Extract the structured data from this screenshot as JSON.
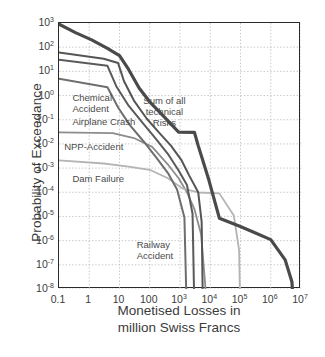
{
  "chart_data": {
    "type": "line",
    "title": "",
    "xlabel": "Monetised Losses in million Swiss Francs",
    "ylabel": "Probability of Exceedance",
    "xscale": "log",
    "yscale": "log",
    "xlim": [
      0.1,
      10000000
    ],
    "ylim": [
      1e-08,
      1000
    ],
    "grid": true,
    "legend_position": "inline-annotations",
    "xticks": [
      "0.1",
      "1",
      "10",
      "100",
      "10³",
      "10⁴",
      "10⁵",
      "10⁶",
      "10⁷"
    ],
    "xtick_values": [
      0.1,
      1,
      10,
      100,
      1000,
      10000,
      100000,
      1000000,
      10000000
    ],
    "yticks": [
      "10³",
      "10²",
      "10¹",
      "10⁰",
      "10⁻¹",
      "10⁻²",
      "10⁻³",
      "10⁻⁴",
      "10⁻⁵",
      "10⁻⁶",
      "10⁻⁷",
      "10⁻⁸"
    ],
    "ytick_values": [
      1000,
      100,
      10,
      1,
      0.1,
      0.01,
      0.001,
      0.0001,
      1e-05,
      1e-06,
      1e-07,
      1e-08
    ],
    "series": [
      {
        "name": "Sum of all technical Risks",
        "color": "#4a4a4a",
        "width": 3.2,
        "points": [
          [
            0.1,
            900
          ],
          [
            0.35,
            400
          ],
          [
            1.2,
            200
          ],
          [
            4,
            90
          ],
          [
            10,
            45
          ],
          [
            20,
            12
          ],
          [
            45,
            2.0
          ],
          [
            100,
            0.55
          ],
          [
            300,
            0.13
          ],
          [
            900,
            0.031
          ],
          [
            3000,
            0.03
          ],
          [
            4000,
            0.0085
          ],
          [
            9000,
            0.00032
          ],
          [
            20000,
            8.5e-06
          ],
          [
            90000,
            4e-06
          ],
          [
            300000,
            2.1e-06
          ],
          [
            1000000,
            1.1e-06
          ],
          [
            3000000,
            1.6e-07
          ],
          [
            5000000,
            2e-08
          ],
          [
            5200000,
            1e-08
          ]
        ]
      },
      {
        "name": "Chemical Accident",
        "color": "#555555",
        "width": 2.0,
        "points": [
          [
            0.1,
            60
          ],
          [
            3,
            33
          ],
          [
            9,
            22
          ],
          [
            14,
            4.0
          ],
          [
            30,
            0.62
          ],
          [
            80,
            0.11
          ],
          [
            200,
            0.03
          ],
          [
            500,
            0.0085
          ],
          [
            1100,
            0.0022
          ],
          [
            2000,
            0.0005
          ],
          [
            4000,
            0.0001
          ],
          [
            5200,
            6e-06
          ],
          [
            5600,
            1e-08
          ]
        ]
      },
      {
        "name": "Airplane Crash",
        "color": "#5a5a5a",
        "width": 2.0,
        "points": [
          [
            0.1,
            30
          ],
          [
            4,
            17
          ],
          [
            8,
            2.3
          ],
          [
            20,
            0.38
          ],
          [
            60,
            0.07
          ],
          [
            160,
            0.016
          ],
          [
            420,
            0.0035
          ],
          [
            900,
            0.0008
          ],
          [
            1700,
            0.0002
          ],
          [
            2600,
            1.3e-05
          ],
          [
            2900,
            1e-08
          ]
        ]
      },
      {
        "name": "NPP-Accident",
        "color": "#8d8d8d",
        "width": 1.8,
        "points": [
          [
            0.1,
            0.03
          ],
          [
            6,
            0.028
          ],
          [
            30,
            0.0175
          ],
          [
            120,
            0.0075
          ],
          [
            400,
            0.0014
          ],
          [
            900,
            0.00038
          ],
          [
            1700,
            0.0001
          ],
          [
            3000,
            2e-05
          ],
          [
            5000,
            1.8e-06
          ],
          [
            7000,
            1e-08
          ]
        ]
      },
      {
        "name": "Dam Failure",
        "color": "#b4b4b4",
        "width": 1.8,
        "points": [
          [
            0.1,
            0.0021
          ],
          [
            3,
            0.00155
          ],
          [
            20,
            0.00115
          ],
          [
            100,
            0.00085
          ],
          [
            400,
            0.00038
          ],
          [
            1200,
            0.000145
          ],
          [
            4000,
            9.8e-05
          ],
          [
            20000,
            9e-05
          ],
          [
            60000,
            1.1e-05
          ],
          [
            90000,
            4e-07
          ],
          [
            95000,
            1e-08
          ]
        ]
      },
      {
        "name": "Railway Accident",
        "color": "#6e6e6e",
        "width": 2.0,
        "points": [
          [
            0.1,
            5.0
          ],
          [
            4,
            2.2
          ],
          [
            9,
            0.32
          ],
          [
            22,
            0.06
          ],
          [
            65,
            0.012
          ],
          [
            170,
            0.0026
          ],
          [
            400,
            0.00062
          ],
          [
            800,
            0.00013
          ],
          [
            1400,
            9e-06
          ],
          [
            1600,
            1e-08
          ]
        ]
      }
    ],
    "annotations": [
      {
        "id": "chemical-accident",
        "lines": [
          "Chemical",
          "Accident"
        ],
        "align": "left",
        "x": 0.3,
        "y": 1.3
      },
      {
        "id": "airplane-crash",
        "lines": [
          "Airplane Crash"
        ],
        "align": "left",
        "x": 0.3,
        "y": 0.13
      },
      {
        "id": "npp-accident",
        "lines": [
          "NPP-Accident"
        ],
        "align": "left",
        "x": 0.16,
        "y": 0.012
      },
      {
        "id": "dam-failure",
        "lines": [
          "Dam Failure"
        ],
        "align": "left",
        "x": 0.3,
        "y": 0.00055
      },
      {
        "id": "sum-technical-risks",
        "lines": [
          "Sum of all",
          "technical",
          "Risks"
        ],
        "align": "center",
        "x": 330,
        "y": 1.0
      },
      {
        "id": "railway-accident",
        "lines": [
          "Railway",
          "Accident"
        ],
        "align": "left",
        "x": 40,
        "y": 1.1e-06
      }
    ]
  }
}
